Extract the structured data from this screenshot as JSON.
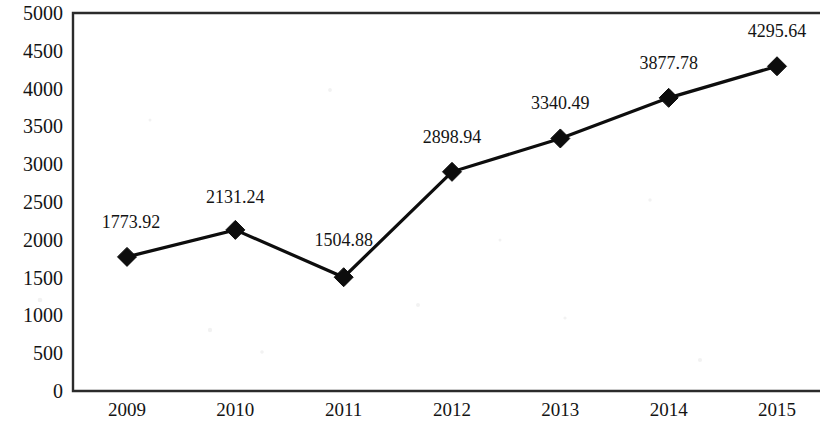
{
  "chart_data": {
    "type": "line",
    "title": "",
    "subtitle": "",
    "xlabel": "",
    "ylabel": "",
    "categories": [
      "2009",
      "2010",
      "2011",
      "2012",
      "2013",
      "2014",
      "2015"
    ],
    "values": [
      1773.92,
      2131.24,
      1504.88,
      2898.94,
      3340.49,
      3877.78,
      4295.64
    ],
    "point_labels": [
      "1773.92",
      "2131.24",
      "1504.88",
      "2898.94",
      "3340.49",
      "3877.78",
      "4295.64"
    ],
    "series": [
      {
        "name": "",
        "values": [
          1773.92,
          2131.24,
          1504.88,
          2898.94,
          3340.49,
          3877.78,
          4295.64
        ]
      }
    ],
    "ylim": [
      0,
      5000
    ],
    "y_tick_step": 500,
    "y_ticks": [
      "0",
      "500",
      "1000",
      "1500",
      "2000",
      "2500",
      "3000",
      "3500",
      "4000",
      "4500",
      "5000"
    ],
    "grid": false,
    "legend": false,
    "legend_position": "none",
    "marker": "diamond",
    "line_color": "#0d0d0d",
    "marker_color": "#0d0d0d",
    "frame_color": "#2b2b2b",
    "background_color": "#ffffff",
    "data_labels_shown": true
  }
}
